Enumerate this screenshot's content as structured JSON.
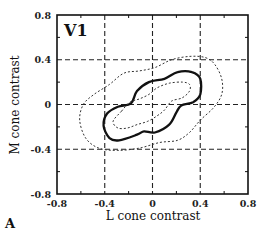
{
  "chart_data": {
    "type": "line",
    "title": "V1",
    "panel_label": "A",
    "xlabel": "L cone contrast",
    "ylabel": "M cone contrast",
    "xlim": [
      -0.8,
      0.8
    ],
    "ylim": [
      -0.8,
      0.8
    ],
    "xticks": [
      "-0.8",
      "-0.4",
      "0",
      "0.4",
      "0.8"
    ],
    "yticks": [
      "0.8",
      "0.4",
      "0",
      "-0.4",
      "-0.8"
    ],
    "grid": "dashed at ±0.4 and 0",
    "legend": null,
    "series": [
      {
        "name": "outer contour",
        "style": "dotted",
        "closed": true,
        "points": [
          [
            -0.61,
            -0.14
          ],
          [
            -0.58,
            0.0
          ],
          [
            -0.49,
            0.09
          ],
          [
            -0.36,
            0.18
          ],
          [
            -0.24,
            0.28
          ],
          [
            -0.11,
            0.3
          ],
          [
            0.02,
            0.33
          ],
          [
            0.16,
            0.4
          ],
          [
            0.31,
            0.43
          ],
          [
            0.44,
            0.42
          ],
          [
            0.52,
            0.36
          ],
          [
            0.58,
            0.23
          ],
          [
            0.58,
            0.09
          ],
          [
            0.51,
            -0.03
          ],
          [
            0.4,
            -0.14
          ],
          [
            0.31,
            -0.25
          ],
          [
            0.21,
            -0.32
          ],
          [
            0.06,
            -0.34
          ],
          [
            -0.11,
            -0.39
          ],
          [
            -0.29,
            -0.41
          ],
          [
            -0.45,
            -0.39
          ],
          [
            -0.56,
            -0.3
          ]
        ]
      },
      {
        "name": "middle contour",
        "style": "solid-bold",
        "closed": true,
        "points": [
          [
            -0.18,
            0.01
          ],
          [
            -0.13,
            0.12
          ],
          [
            -0.03,
            0.2
          ],
          [
            0.1,
            0.23
          ],
          [
            0.21,
            0.29
          ],
          [
            0.33,
            0.29
          ],
          [
            0.4,
            0.23
          ],
          [
            0.4,
            0.09
          ],
          [
            0.34,
            0.02
          ],
          [
            0.24,
            -0.01
          ],
          [
            0.2,
            -0.07
          ],
          [
            0.14,
            -0.18
          ],
          [
            0.02,
            -0.25
          ],
          [
            -0.07,
            -0.24
          ],
          [
            -0.13,
            -0.27
          ],
          [
            -0.28,
            -0.32
          ],
          [
            -0.36,
            -0.3
          ],
          [
            -0.41,
            -0.19
          ],
          [
            -0.38,
            -0.08
          ],
          [
            -0.29,
            -0.02
          ]
        ]
      },
      {
        "name": "inner contour",
        "style": "dotted",
        "closed": true,
        "points": [
          [
            -0.26,
            -0.06
          ],
          [
            -0.19,
            0.02
          ],
          [
            -0.11,
            0.05
          ],
          [
            -0.03,
            0.09
          ],
          [
            0.04,
            0.15
          ],
          [
            0.14,
            0.19
          ],
          [
            0.25,
            0.2
          ],
          [
            0.31,
            0.18
          ],
          [
            0.31,
            0.12
          ],
          [
            0.25,
            0.06
          ],
          [
            0.16,
            0.03
          ],
          [
            0.1,
            -0.05
          ],
          [
            0.04,
            -0.1
          ],
          [
            -0.04,
            -0.15
          ],
          [
            -0.13,
            -0.18
          ],
          [
            -0.21,
            -0.21
          ],
          [
            -0.29,
            -0.21
          ],
          [
            -0.33,
            -0.15
          ]
        ]
      }
    ]
  }
}
